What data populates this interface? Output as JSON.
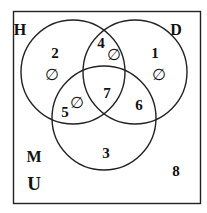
{
  "diagram": {
    "type": "venn",
    "universe_label": "U",
    "sets": [
      {
        "name": "H",
        "cx": 73,
        "cy": 72,
        "r": 52,
        "label_x": 20,
        "label_y": 35
      },
      {
        "name": "D",
        "cx": 135,
        "cy": 72,
        "r": 52,
        "label_x": 176,
        "label_y": 35
      },
      {
        "name": "M",
        "cx": 104,
        "cy": 118,
        "r": 52,
        "label_x": 34,
        "label_y": 162
      }
    ],
    "regions": [
      {
        "id": "H_only",
        "number": "2",
        "x": 55,
        "y": 58,
        "empty": true,
        "empty_x": 52,
        "empty_y": 80
      },
      {
        "id": "H_and_D_only",
        "number": "4",
        "x": 101,
        "y": 48,
        "empty": true,
        "empty_x": 114,
        "empty_y": 60
      },
      {
        "id": "D_only",
        "number": "1",
        "x": 155,
        "y": 58,
        "empty": true,
        "empty_x": 159,
        "empty_y": 80
      },
      {
        "id": "H_D_M",
        "number": "7",
        "x": 107,
        "y": 98,
        "empty": false
      },
      {
        "id": "H_and_M_only",
        "number": "5",
        "x": 65,
        "y": 117,
        "empty": true,
        "empty_x": 77,
        "empty_y": 108
      },
      {
        "id": "D_and_M_only",
        "number": "6",
        "x": 139,
        "y": 110,
        "empty": false
      },
      {
        "id": "M_only",
        "number": "3",
        "x": 106,
        "y": 158,
        "empty": false
      },
      {
        "id": "outside",
        "number": "8",
        "x": 176,
        "y": 176,
        "empty": false
      }
    ],
    "empty_symbol": "∅",
    "universe_label_pos": {
      "x": 34,
      "y": 190
    }
  }
}
